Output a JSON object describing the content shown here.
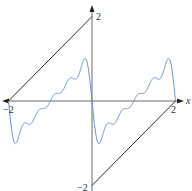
{
  "chart_data": {
    "type": "line",
    "title": "",
    "xlabel": "x",
    "ylabel": "",
    "xlim": [
      -2.1,
      2.2
    ],
    "ylim": [
      -2.1,
      2.2
    ],
    "x_ticks": [
      "-2",
      "2"
    ],
    "y_ticks": [
      "2",
      "-2"
    ],
    "grid": false,
    "legend": null,
    "series": [
      {
        "name": "f(x)",
        "color": "#2b2b2b",
        "segments": [
          [
            [
              -2,
              0
            ],
            [
              0,
              2
            ]
          ],
          [
            [
              0,
              -2
            ],
            [
              2,
              0
            ]
          ]
        ]
      },
      {
        "name": "Fourier partial sum S5(x)",
        "color": "#6b8fc4",
        "terms": 5,
        "formula": "-sum_{n=1}^{5} (4/(n*pi)) sin(n*pi*x/2)... periodic sawtooth approximation"
      }
    ]
  },
  "labels": {
    "x_axis": "x",
    "x_neg": "−2",
    "x_pos": "2",
    "y_pos": "2",
    "y_neg": "−2"
  }
}
